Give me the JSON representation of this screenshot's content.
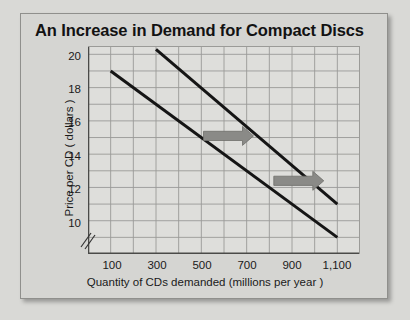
{
  "figure": {
    "title": "An Increase in Demand for Compact Discs",
    "background_color": "#d5d5d2",
    "plot_background_color": "#dededb"
  },
  "axes": {
    "y_title": "Price per CD ( dollars )",
    "x_title": "Quantity of CDs demanded (millions per year )",
    "y_ticks": [
      "20",
      "18",
      "16",
      "14",
      "12",
      "10"
    ],
    "x_ticks": [
      "100",
      "300",
      "500",
      "700",
      "900",
      "1,100"
    ],
    "axis_break_symbol": "//"
  },
  "chart_data": {
    "type": "line",
    "title": "An Increase in Demand for Compact Discs",
    "xlabel": "Quantity of CDs demanded (millions per year )",
    "ylabel": "Price per CD ( dollars )",
    "xlim": [
      0,
      1200
    ],
    "ylim": [
      9,
      21.5
    ],
    "xticks": [
      100,
      300,
      500,
      700,
      900,
      1100
    ],
    "xticklabels": [
      "100",
      "300",
      "500",
      "700",
      "900",
      "1,100"
    ],
    "yticks": [
      10,
      12,
      14,
      16,
      18,
      20
    ],
    "yticklabels": [
      "20",
      "18",
      "16",
      "14",
      "12",
      "10"
    ],
    "grid": true,
    "grid_x_step": 100,
    "grid_y_step": 1,
    "legend": "none",
    "series": [
      {
        "name": "Original demand",
        "color": "#151515",
        "linewidth": 3,
        "points": [
          [
            100,
            20.0
          ],
          [
            1100,
            10.0
          ]
        ]
      },
      {
        "name": "New demand (shifted right)",
        "color": "#151515",
        "linewidth": 3,
        "points": [
          [
            300,
            21.3
          ],
          [
            1100,
            12.0
          ]
        ]
      }
    ],
    "annotations": [
      {
        "type": "block-arrow",
        "direction": "right",
        "color": "#8a8a87",
        "x": 620,
        "y": 16.1
      },
      {
        "type": "block-arrow",
        "direction": "right",
        "color": "#8a8a87",
        "x": 930,
        "y": 13.4
      }
    ]
  }
}
